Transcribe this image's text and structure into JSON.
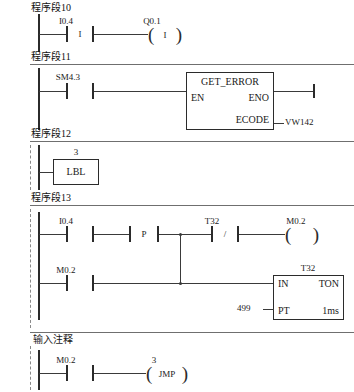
{
  "document": {
    "type": "ladder-logic-diagram",
    "language": "LAD",
    "line_color": "#2b2b2b"
  },
  "networks": [
    {
      "title": "程序段10",
      "elements": {
        "contact1": {
          "label": "I0.4",
          "symbol": "I",
          "type": "normally-open"
        },
        "coil1": {
          "label": "Q0.1",
          "symbol": "I",
          "type": "output-coil"
        }
      }
    },
    {
      "title": "程序段11",
      "elements": {
        "contact1": {
          "label": "SM4.3",
          "symbol": "",
          "type": "normally-open"
        },
        "box": {
          "title": "GET_ERROR",
          "pin_en": "EN",
          "pin_eno": "ENO",
          "pin_ecode": "ECODE",
          "ecode_operand": "VW142"
        }
      }
    },
    {
      "title": "程序段12",
      "elements": {
        "lbl": {
          "label": "3",
          "text": "LBL"
        }
      }
    },
    {
      "title": "程序段13",
      "elements": {
        "contact1": {
          "label": "I0.4",
          "symbol": "",
          "type": "normally-open"
        },
        "edge": {
          "symbol": "P",
          "type": "positive-transition"
        },
        "contact_t32": {
          "label": "T32",
          "symbol": "/",
          "type": "normally-closed"
        },
        "coil_m02": {
          "label": "M0.2",
          "symbol": "",
          "type": "output-coil"
        },
        "contact_m02": {
          "label": "M0.2",
          "symbol": "",
          "type": "normally-open"
        },
        "timer": {
          "label": "T32",
          "pin_in": "IN",
          "pin_type": "TON",
          "pin_pt": "PT",
          "timebase": "1ms",
          "preset": "499"
        }
      }
    },
    {
      "title": "输入注释",
      "elements": {
        "contact1": {
          "label": "M0.2",
          "symbol": "",
          "type": "normally-open"
        },
        "coil_jmp": {
          "label": "3",
          "text": "JMP",
          "type": "jump-coil"
        }
      }
    }
  ]
}
